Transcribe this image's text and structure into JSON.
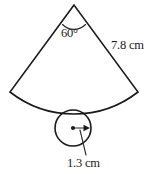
{
  "figure": {
    "background_color": "#ffffff",
    "line_color": "#1a1a1a",
    "labels": {
      "angle": "60°",
      "sector_radius": "7.8 cm",
      "circle_radius": "1.3 cm"
    },
    "shapes": {
      "sector": {
        "apex": [
          74,
          5
        ],
        "left_corner": [
          10,
          92
        ],
        "right_corner": [
          138,
          92
        ],
        "arc_sag_point": [
          74,
          110
        ],
        "angle_degrees": 60,
        "slant_length_label": "7.8 cm"
      },
      "circle": {
        "center": [
          73,
          128
        ],
        "radius_px": 18,
        "radius_label": "1.3 cm",
        "radius_arrow_tip": [
          89,
          128
        ]
      }
    }
  }
}
